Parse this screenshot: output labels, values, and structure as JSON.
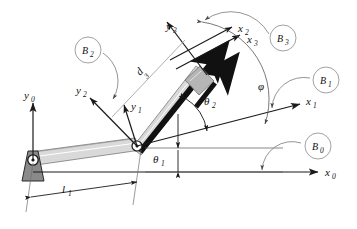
{
  "diagram": {
    "type": "mechanism-schematic",
    "background_color": "#ffffff",
    "line_color": "#1a1a1a",
    "link_fill": "#d9d9d9",
    "base_fill": "#8a8a8a",
    "slider_fill": "#b5b5b5",
    "rod_fill": "#111111",
    "leader_color": "#7a7a7a"
  },
  "frames": [
    {
      "id": "frame0",
      "origin": "base-pivot",
      "x_axis": {
        "base": "x",
        "sub": "0"
      },
      "y_axis": {
        "base": "y",
        "sub": "0"
      }
    },
    {
      "id": "frame1",
      "origin": "elbow-joint",
      "x_axis": {
        "base": "x",
        "sub": "1"
      },
      "y_axis": {
        "base": "y",
        "sub": "1"
      }
    },
    {
      "id": "frame2",
      "origin": "elbow-joint",
      "x_axis": {
        "base": "x",
        "sub": "2"
      },
      "y_axis": {
        "base": "y",
        "sub": "2"
      }
    },
    {
      "id": "frame3",
      "origin": "slider",
      "x_axis": {
        "base": "x",
        "sub": "3"
      },
      "y_axis": {
        "base": "y",
        "sub": "3"
      }
    }
  ],
  "axis_labels": {
    "x0": {
      "base": "x",
      "sub": "0"
    },
    "y0": {
      "base": "y",
      "sub": "0"
    },
    "x1": {
      "base": "x",
      "sub": "1"
    },
    "y1": {
      "base": "y",
      "sub": "1"
    },
    "x2": {
      "base": "x",
      "sub": "2"
    },
    "y2": {
      "base": "y",
      "sub": "2"
    },
    "x3": {
      "base": "x",
      "sub": "3"
    },
    "y3": {
      "base": "y",
      "sub": "3"
    }
  },
  "bodies": [
    {
      "id": "B0",
      "base": "B",
      "sub": "0",
      "cx": 318,
      "cy": 146,
      "r": 13
    },
    {
      "id": "B1",
      "base": "B",
      "sub": "1",
      "cx": 326,
      "cy": 80,
      "r": 13
    },
    {
      "id": "B2",
      "base": "B",
      "sub": "2",
      "cx": 88,
      "cy": 50,
      "r": 13
    },
    {
      "id": "B3",
      "base": "B",
      "sub": "3",
      "cx": 283,
      "cy": 38,
      "r": 13
    }
  ],
  "parameters": [
    {
      "id": "l1",
      "base": "l",
      "sub": "1",
      "kind": "length",
      "description": "first link length"
    },
    {
      "id": "d3",
      "base": "d",
      "sub": "3",
      "kind": "length",
      "description": "prismatic joint extension"
    },
    {
      "id": "theta1",
      "base": "θ",
      "sub": "1",
      "kind": "angle",
      "description": "base joint angle"
    },
    {
      "id": "theta2",
      "base": "θ",
      "sub": "2",
      "kind": "angle",
      "description": "elbow joint angle"
    },
    {
      "id": "phi",
      "base": "φ",
      "sub": "",
      "kind": "angle",
      "description": "end-effector orientation"
    }
  ],
  "joints": [
    {
      "id": "base-pivot",
      "type": "revolute",
      "x": 33,
      "y": 160
    },
    {
      "id": "elbow-joint",
      "type": "revolute",
      "x": 137,
      "y": 146
    },
    {
      "id": "prismatic-slider",
      "type": "prismatic",
      "x": 205,
      "y": 78
    }
  ]
}
